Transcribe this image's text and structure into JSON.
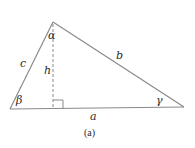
{
  "diagram": {
    "caption": "(a)",
    "colors": {
      "stroke": "#8a8a8a",
      "text": "#2a2a2a",
      "background": "#ffffff"
    },
    "vertices": {
      "top": [
        53,
        22
      ],
      "bottom_left": [
        10,
        109
      ],
      "bottom_right": [
        184,
        107
      ]
    },
    "altitude": {
      "from": [
        53,
        22
      ],
      "to": [
        53,
        108
      ],
      "style": "dashed",
      "right_angle_marker": true
    },
    "labels": {
      "alpha": "α",
      "beta": "β",
      "gamma": "γ",
      "side_a": "a",
      "side_b": "b",
      "side_c": "c",
      "height": "h"
    }
  }
}
